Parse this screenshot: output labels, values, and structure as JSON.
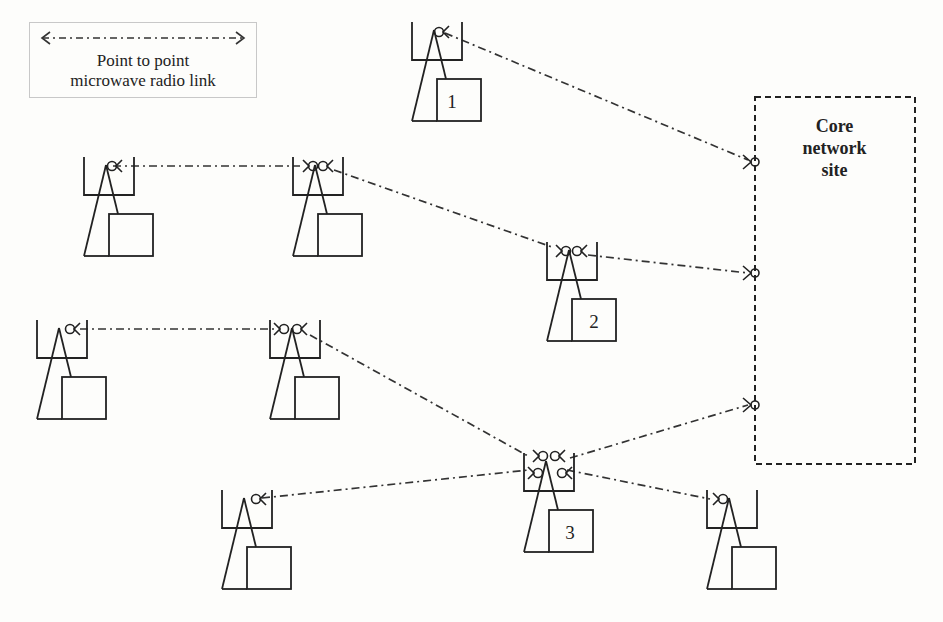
{
  "legend": {
    "line1": "Point to point",
    "line2": "microwave radio link",
    "line_style": "dash-dot with arrows both ends"
  },
  "core_site": {
    "title_lines": [
      "Core",
      "network",
      "site"
    ],
    "border_style": "dashed"
  },
  "sites": [
    {
      "id": "site-1",
      "label": "1",
      "x": 412,
      "y": 22
    },
    {
      "id": "site-a",
      "label": "",
      "x": 84,
      "y": 157
    },
    {
      "id": "site-b",
      "label": "",
      "x": 293,
      "y": 157
    },
    {
      "id": "site-2",
      "label": "2",
      "x": 547,
      "y": 242
    },
    {
      "id": "site-c",
      "label": "",
      "x": 37,
      "y": 320
    },
    {
      "id": "site-d",
      "label": "",
      "x": 270,
      "y": 320
    },
    {
      "id": "site-3",
      "label": "3",
      "x": 524,
      "y": 453
    },
    {
      "id": "site-e",
      "label": "",
      "x": 222,
      "y": 490
    },
    {
      "id": "site-f",
      "label": "",
      "x": 707,
      "y": 490
    }
  ],
  "links": [
    {
      "from": "site-1",
      "to": "core-1"
    },
    {
      "from": "site-a",
      "to": "site-b"
    },
    {
      "from": "site-b",
      "to": "site-2"
    },
    {
      "from": "site-2",
      "to": "core-2"
    },
    {
      "from": "site-c",
      "to": "site-d"
    },
    {
      "from": "site-d",
      "to": "site-3"
    },
    {
      "from": "site-3",
      "to": "core-3"
    },
    {
      "from": "site-e",
      "to": "site-3"
    },
    {
      "from": "site-3",
      "to": "site-f"
    }
  ],
  "colors": {
    "line": "#222222",
    "background": "#fdfdfb",
    "legend_border": "#c8c8c8"
  }
}
